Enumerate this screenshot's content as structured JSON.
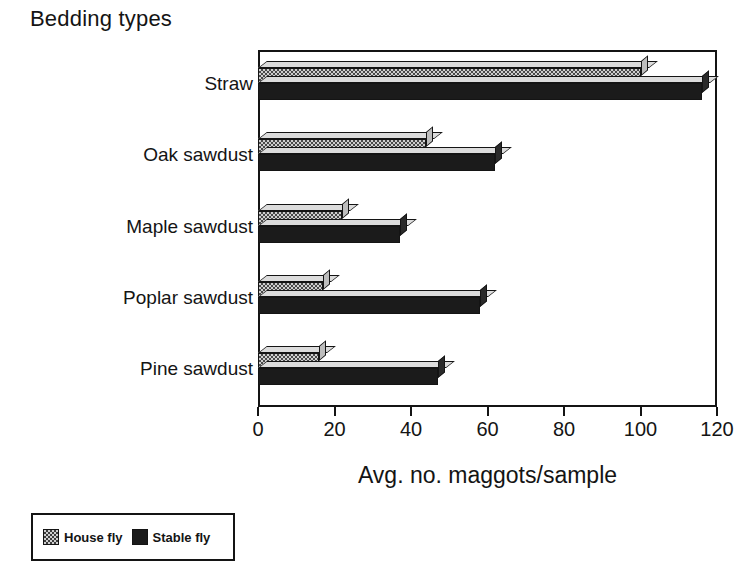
{
  "chart_data": {
    "type": "bar",
    "orientation": "horizontal",
    "title": "Bedding types",
    "subtitle": "",
    "xlabel": "Avg. no. maggots/sample",
    "ylabel": "Bedding types",
    "categories": [
      "Straw",
      "Oak sawdust",
      "Maple sawdust",
      "Poplar sawdust",
      "Pine sawdust"
    ],
    "series": [
      {
        "name": "House fly",
        "values": [
          100,
          44,
          22,
          17,
          16
        ],
        "style": "checkered-light"
      },
      {
        "name": "Stable fly",
        "values": [
          116,
          62,
          37,
          58,
          47
        ],
        "style": "solid-black"
      }
    ],
    "xlim": [
      0,
      120
    ],
    "xticks": [
      0,
      20,
      40,
      60,
      80,
      100,
      120
    ],
    "xtick_labels": [
      "0",
      "20",
      "40",
      "60",
      "80",
      "100",
      "120"
    ],
    "grid": false,
    "legend_position": "below-left",
    "frame": "box",
    "threed": true
  },
  "legend": {
    "entries": [
      {
        "label": "House fly",
        "swatch": "checkered-light-swatch"
      },
      {
        "label": "Stable fly",
        "swatch": "solid-black-swatch"
      }
    ]
  },
  "colors": {
    "axis": "#141414",
    "house_fly_fill": "#cfcfcf",
    "house_fly_pattern": "#4a4a4a",
    "stable_fly_fill": "#1b1b1b",
    "background": "#ffffff",
    "text": "#141414"
  }
}
